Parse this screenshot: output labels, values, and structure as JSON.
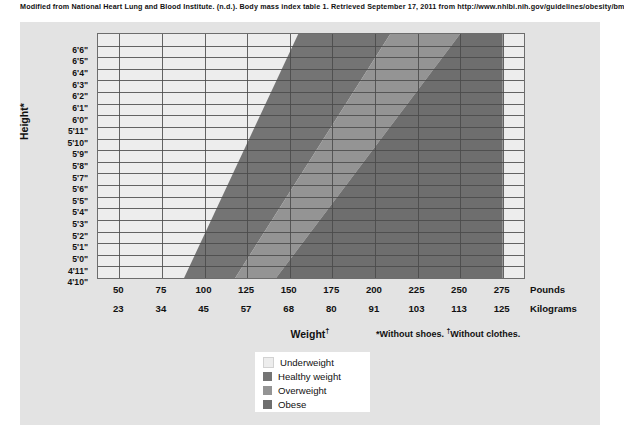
{
  "citation": "Modified from National Heart Lung and Blood Institute. (n.d.). Body mass index table 1. Retrieved September 17, 2011 from http://www.nhlbi.nih.gov/guidelines/obesity/bmi_tbl.htm",
  "axes": {
    "y_title": "Height*",
    "x_title": "Weight",
    "x_title_dagger": "†",
    "unit_pounds": "Pounds",
    "unit_kilograms": "Kilograms",
    "footnotes": "*Without shoes.  †Without clothes."
  },
  "legend": {
    "items": [
      {
        "label": "Underweight",
        "color": "#ededed"
      },
      {
        "label": "Healthy weight",
        "color": "#747474"
      },
      {
        "label": "Overweight",
        "color": "#949494"
      },
      {
        "label": "Obese",
        "color": "#6e6e6e"
      }
    ]
  },
  "chart_data": {
    "type": "area",
    "xlabel": "Weight",
    "ylabel": "Height",
    "grid": true,
    "legend_position": "bottom-center",
    "x": [
      50,
      75,
      100,
      125,
      150,
      175,
      200,
      225,
      250,
      275
    ],
    "x_kilograms": [
      23,
      34,
      45,
      57,
      68,
      80,
      91,
      103,
      113,
      125
    ],
    "xlim": [
      37.5,
      287.5
    ],
    "ylim": [
      "4'10\"",
      "6'6\""
    ],
    "heights": [
      "6'6\"",
      "6'5\"",
      "6'4\"",
      "6'3\"",
      "6'2\"",
      "6'1\"",
      "6'0\"",
      "5'11\"",
      "5'10\"",
      "5'9\"",
      "5'8\"",
      "5'7\"",
      "5'6\"",
      "5'5\"",
      "5'4\"",
      "5'3\"",
      "5'2\"",
      "5'1\"",
      "5'0\"",
      "4'11\"",
      "4'10\""
    ],
    "series": [
      {
        "name": "Underweight",
        "bmi_range": "below 18.5",
        "color": "#ededed",
        "boundary_weight_lb": {
          "at_6ft6in": 155,
          "at_4ft10in": 88
        }
      },
      {
        "name": "Healthy weight",
        "bmi_range": "18.5 to 24.9",
        "color": "#747474",
        "boundary_weight_lb": {
          "at_6ft6in": 209,
          "at_4ft10in": 118
        }
      },
      {
        "name": "Overweight",
        "bmi_range": "25.0 to 29.9",
        "color": "#949494",
        "boundary_weight_lb": {
          "at_6ft6in": 250,
          "at_4ft10in": 142
        }
      },
      {
        "name": "Obese",
        "bmi_range": "30.0 and above",
        "color": "#6e6e6e",
        "boundary_weight_lb": {
          "at_6ft6in": 275,
          "at_4ft10in": 275
        }
      }
    ]
  }
}
